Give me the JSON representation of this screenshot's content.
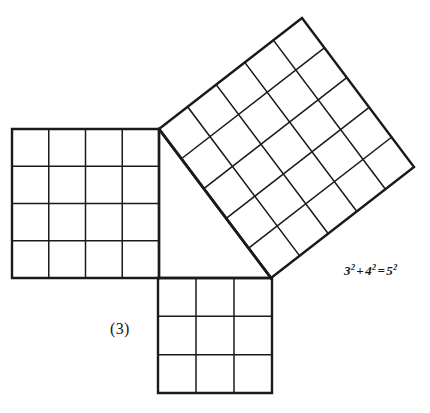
{
  "figure": {
    "figure_number_label": "(3)",
    "equation": {
      "full_text": "3² + 4² = 5²",
      "base_a": "3",
      "exp_a": "2",
      "plus": "+",
      "base_b": "4",
      "exp_b": "2",
      "equals": "=",
      "base_c": "5",
      "exp_c": "2"
    },
    "colors": {
      "background": "#ffffff",
      "stroke": "#1a1a1a",
      "text": "#171717"
    },
    "stroke_widths": {
      "outline": 2.4,
      "grid": 1.5,
      "hypotenuse": 2.8
    },
    "triangle": {
      "name": "right-triangle-3-4-5",
      "vertices": [
        {
          "name": "apex-top-left",
          "x": 159,
          "y": 129
        },
        {
          "name": "right-angle-corner",
          "x": 159,
          "y": 278
        },
        {
          "name": "vertex-bottom-right",
          "x": 271,
          "y": 278
        }
      ],
      "leg_vertical_units": 4,
      "leg_horizontal_units": 3,
      "hypotenuse_units": 5
    },
    "squares": [
      {
        "id": "square-on-vertical-leg",
        "label": "square of side 4",
        "side_units": 4,
        "cells": 16,
        "divisions": 4,
        "corners": [
          {
            "x": 12,
            "y": 129
          },
          {
            "x": 159,
            "y": 129
          },
          {
            "x": 159,
            "y": 278
          },
          {
            "x": 12,
            "y": 278
          }
        ]
      },
      {
        "id": "square-on-horizontal-leg",
        "label": "square of side 3",
        "side_units": 3,
        "cells": 9,
        "divisions": 3,
        "corners": [
          {
            "x": 158,
            "y": 278
          },
          {
            "x": 272,
            "y": 278
          },
          {
            "x": 272,
            "y": 393
          },
          {
            "x": 158,
            "y": 393
          }
        ]
      },
      {
        "id": "square-on-hypotenuse",
        "label": "square of side 5",
        "side_units": 5,
        "cells": 25,
        "divisions": 5,
        "corners": [
          {
            "x": 159,
            "y": 129
          },
          {
            "x": 302,
            "y": 18
          },
          {
            "x": 414,
            "y": 167
          },
          {
            "x": 271,
            "y": 278
          }
        ]
      }
    ]
  }
}
